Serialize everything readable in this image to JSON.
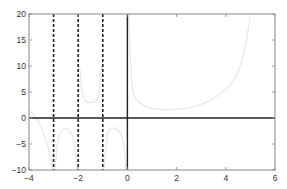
{
  "chart_data": {
    "type": "line",
    "title": "",
    "xlabel": "",
    "ylabel": "",
    "xlim": [
      -4,
      6
    ],
    "ylim": [
      -10,
      20
    ],
    "xticks": [
      -4,
      -2,
      0,
      2,
      4,
      6
    ],
    "yticks": [
      -10,
      -5,
      0,
      5,
      10,
      15,
      20
    ],
    "grid": false,
    "legend": null,
    "series": [
      {
        "name": "function curve",
        "style": "solid light gray",
        "color": "#e6e6e6",
        "description": "rational-type function with vertical asymptotes at x=-3, -2, -1, 0; upward branch from x=0 to about x=5",
        "segments": [
          {
            "x": [
              -4,
              -3.7,
              -3.4,
              -3.15,
              -3.05
            ],
            "y": [
              1.5,
              0,
              -3,
              -7,
              -10
            ]
          },
          {
            "x": [
              -2.95,
              -2.8,
              -2.5,
              -2.2,
              -2.05
            ],
            "y": [
              -10,
              -4,
              -2,
              -4,
              -10
            ]
          },
          {
            "x": [
              -1.95,
              -1.8,
              -1.5,
              -1.2,
              -1.05
            ],
            "y": [
              10,
              4,
              3,
              4,
              10
            ]
          },
          {
            "x": [
              -0.95,
              -0.8,
              -0.5,
              -0.2,
              -0.05
            ],
            "y": [
              -10,
              -3,
              -2,
              -4,
              -10
            ]
          },
          {
            "x": [
              0.05,
              0.2,
              0.5,
              1,
              2,
              3,
              4,
              4.5,
              4.8,
              5.0
            ],
            "y": [
              20,
              6,
              3,
              1.8,
              1.7,
              2.6,
              5.5,
              9,
              14,
              20
            ]
          }
        ]
      }
    ],
    "reference_lines": [
      {
        "orientation": "vertical",
        "x": -3,
        "style": "dashed",
        "color": "#222222"
      },
      {
        "orientation": "vertical",
        "x": -2,
        "style": "dashed",
        "color": "#222222"
      },
      {
        "orientation": "vertical",
        "x": -1,
        "style": "dashed",
        "color": "#222222"
      },
      {
        "orientation": "vertical",
        "x": 0,
        "style": "solid",
        "color": "#222222"
      },
      {
        "orientation": "horizontal",
        "y": 0,
        "style": "solid",
        "color": "#222222"
      }
    ]
  },
  "axes": {
    "x_tick_labels": [
      "−4",
      "−2",
      "0",
      "2",
      "4",
      "6"
    ],
    "y_tick_labels": [
      "−10",
      "−5",
      "0",
      "5",
      "10",
      "15",
      "20"
    ]
  }
}
